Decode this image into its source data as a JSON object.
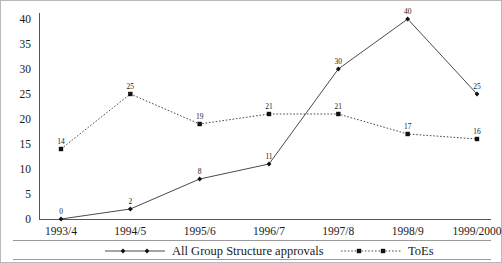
{
  "chart_data": {
    "type": "line",
    "title": "",
    "subtitle": "",
    "xlabel": "",
    "ylabel": "",
    "ylim": [
      0,
      40
    ],
    "yticks": [
      0,
      5,
      10,
      15,
      20,
      25,
      30,
      35,
      40
    ],
    "grid": false,
    "legend_position": "bottom",
    "categories": [
      "1993/4",
      "1994/5",
      "1995/6",
      "1996/7",
      "1997/8",
      "1998/9",
      "1999/2000"
    ],
    "series": [
      {
        "name": "All Group Structure approvals",
        "values": [
          0,
          2,
          8,
          11,
          30,
          40,
          25
        ],
        "line_style": "solid",
        "marker": "diamond",
        "color": "#4a4a4a"
      },
      {
        "name": "ToEs",
        "values": [
          14,
          25,
          19,
          21,
          21,
          17,
          16
        ],
        "line_style": "dotted",
        "marker": "square",
        "color": "#4a4a4a"
      }
    ],
    "data_labels": {
      "All Group Structure approvals": [
        "0",
        "2",
        "8",
        "11",
        "30",
        "40",
        "25"
      ],
      "ToEs": [
        "14",
        "25",
        "19",
        "21",
        "21",
        "17",
        "16"
      ]
    }
  },
  "legend": {
    "items": [
      {
        "label": "All Group Structure approvals",
        "style": "solid",
        "marker": "diamond"
      },
      {
        "label": "ToEs",
        "style": "dotted",
        "marker": "square"
      }
    ]
  },
  "colors": {
    "line": "#4a4a4a",
    "marker": "#111111",
    "axis": "#555555",
    "frame": "#b9b9b9",
    "text": "#1a1a1a"
  }
}
